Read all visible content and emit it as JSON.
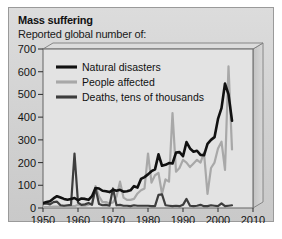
{
  "figure": {
    "title": "Mass suffering",
    "subtitle": "Reported global number of:",
    "background_color": "#d4d4d4",
    "border_color": "#9a9a9a"
  },
  "chart_data": {
    "type": "line",
    "title": "Mass suffering",
    "subtitle": "Reported global number of:",
    "xlabel": "",
    "ylabel": "",
    "xlim": [
      1950,
      2010
    ],
    "ylim": [
      0,
      700
    ],
    "grid": false,
    "legend_position": "top-left",
    "xticks": [
      "1950",
      "1960",
      "1970",
      "1980",
      "1990",
      "2000",
      "2010"
    ],
    "yticks": [
      "0",
      "100",
      "200",
      "300",
      "400",
      "500",
      "600",
      "700"
    ],
    "x": [
      1950,
      1951,
      1952,
      1953,
      1954,
      1955,
      1956,
      1957,
      1958,
      1959,
      1960,
      1961,
      1962,
      1963,
      1964,
      1965,
      1966,
      1967,
      1968,
      1969,
      1970,
      1971,
      1972,
      1973,
      1974,
      1975,
      1976,
      1977,
      1978,
      1979,
      1980,
      1981,
      1982,
      1983,
      1984,
      1985,
      1986,
      1987,
      1988,
      1989,
      1990,
      1991,
      1992,
      1993,
      1994,
      1995,
      1996,
      1997,
      1998,
      1999,
      2000,
      2001,
      2002,
      2003,
      2004
    ],
    "series": [
      {
        "name": "Natural disasters",
        "color": "#111111",
        "width": 2.6,
        "values": [
          22,
          26,
          30,
          42,
          52,
          46,
          40,
          36,
          40,
          44,
          34,
          42,
          40,
          36,
          52,
          88,
          86,
          76,
          74,
          70,
          80,
          76,
          80,
          72,
          74,
          78,
          96,
          90,
          128,
          136,
          148,
          162,
          170,
          236,
          186,
          190,
          198,
          196,
          244,
          246,
          228,
          290,
          262,
          248,
          252,
          234,
          232,
          282,
          300,
          312,
          392,
          440,
          548,
          500,
          384
        ]
      },
      {
        "name": "People affected",
        "color": "#a8a8a8",
        "width": 2.2,
        "values": [
          4,
          4,
          4,
          6,
          6,
          6,
          6,
          6,
          8,
          8,
          14,
          10,
          10,
          14,
          20,
          96,
          52,
          26,
          26,
          20,
          24,
          50,
          116,
          46,
          36,
          36,
          40,
          64,
          78,
          86,
          240,
          112,
          144,
          154,
          62,
          126,
          116,
          418,
          160,
          176,
          212,
          200,
          180,
          196,
          212,
          200,
          244,
          62,
          176,
          200,
          262,
          292,
          168,
          624,
          258
        ]
      },
      {
        "name": "Deaths, tens of thousands",
        "color": "#3d3d3d",
        "width": 2.2,
        "values": [
          18,
          20,
          16,
          26,
          28,
          12,
          10,
          12,
          14,
          240,
          24,
          14,
          16,
          22,
          14,
          88,
          18,
          12,
          14,
          10,
          86,
          12,
          14,
          10,
          10,
          8,
          12,
          10,
          10,
          10,
          10,
          8,
          8,
          58,
          60,
          12,
          10,
          8,
          10,
          8,
          14,
          40,
          10,
          8,
          10,
          14,
          8,
          8,
          12,
          10,
          8,
          20,
          8,
          10,
          12
        ]
      }
    ]
  },
  "legend": {
    "items": [
      {
        "label": "Natural disasters",
        "color": "#111111"
      },
      {
        "label": "People affected",
        "color": "#a8a8a8"
      },
      {
        "label": "Deaths, tens of thousands",
        "color": "#3d3d3d"
      }
    ]
  }
}
